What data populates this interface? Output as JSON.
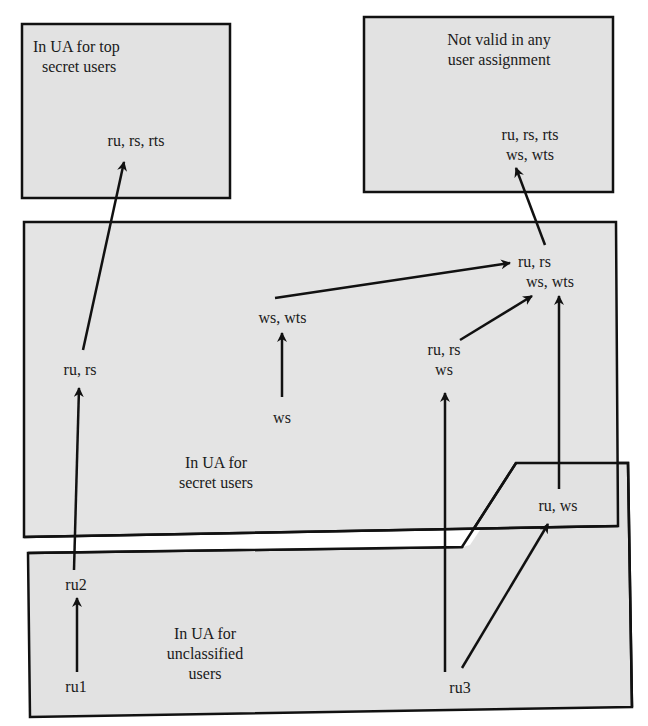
{
  "colors": {
    "fill": "#e2e2e2",
    "stroke": "#111111",
    "background": "#ffffff"
  },
  "regions": {
    "top_secret": {
      "title_line1": "In UA for top",
      "title_line2": "secret users"
    },
    "not_valid": {
      "title_line1": "Not valid in any",
      "title_line2": "user assignment"
    },
    "secret": {
      "title_line1": "In UA for",
      "title_line2": "secret users"
    },
    "unclassified": {
      "title_line1": "In UA for",
      "title_line2": "unclassified",
      "title_line3": "users"
    }
  },
  "nodes": {
    "ts_ru_rs_rts": {
      "line1": "ru, rs, rts"
    },
    "nv_all": {
      "line1": "ru, rs, rts",
      "line2": "ws, wts"
    },
    "ru_rs": {
      "line1": "ru, rs"
    },
    "ws_wts": {
      "line1": "ws, wts"
    },
    "ws": {
      "line1": "ws"
    },
    "ru_rs_ws_wts": {
      "line1": "ru, rs",
      "line2": "ws, wts"
    },
    "ru_rs_ws": {
      "line1": "ru, rs",
      "line2": "ws"
    },
    "ru_ws": {
      "line1": "ru, ws"
    },
    "ru2": {
      "line1": "ru2"
    },
    "ru1": {
      "line1": "ru1"
    },
    "ru3": {
      "line1": "ru3"
    }
  },
  "edges": [
    {
      "from": "ru1",
      "to": "ru2"
    },
    {
      "from": "ru2",
      "to": "ru, rs"
    },
    {
      "from": "ru, rs",
      "to": "ru, rs, rts"
    },
    {
      "from": "ws",
      "to": "ws, wts"
    },
    {
      "from": "ws, wts",
      "to": "ru, rs / ws, wts"
    },
    {
      "from": "ru, rs / ws",
      "to": "ru, rs / ws, wts"
    },
    {
      "from": "ru, ws",
      "to": "ru, rs / ws, wts"
    },
    {
      "from": "ru3",
      "to": "ru, rs / ws"
    },
    {
      "from": "ru3",
      "to": "ru, ws"
    },
    {
      "from": "ru, rs / ws, wts",
      "to": "ru, rs, rts / ws, wts"
    }
  ]
}
